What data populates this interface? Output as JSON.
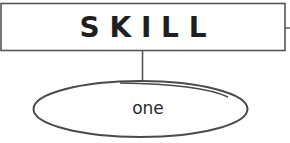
{
  "diagram": {
    "title_box": {
      "label": "S K I L L"
    },
    "child_node": {
      "label": "one"
    },
    "colors": {
      "stroke": "#4a4a4a",
      "text": "#1f1f1f",
      "background": "#ffffff"
    }
  }
}
